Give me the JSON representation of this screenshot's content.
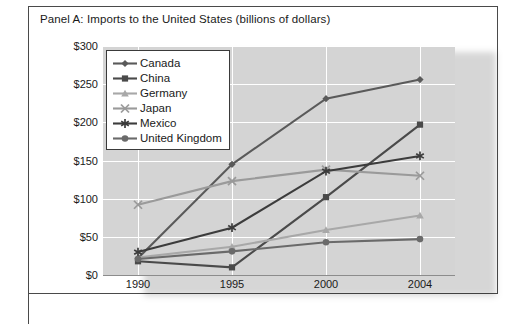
{
  "panel": {
    "title": "Panel A: Imports to the United States (billions of dollars)"
  },
  "chart_data": {
    "type": "line",
    "title": "Panel A: Imports to the United States (billions of dollars)",
    "xlabel": "",
    "ylabel": "Imports to the US (billions)",
    "categories": [
      "1990",
      "1995",
      "2000",
      "2004"
    ],
    "ylim": [
      0,
      300
    ],
    "yticks": [
      "$0",
      "$50",
      "$100",
      "$150",
      "$200",
      "$250",
      "$300"
    ],
    "ytick_values": [
      0,
      50,
      100,
      150,
      200,
      250,
      300
    ],
    "grid": true,
    "legend_position": "top-left-inside",
    "series": [
      {
        "name": "Canada",
        "marker": "diamond",
        "color": "#5a5a5a",
        "values": [
          22,
          145,
          231,
          256
        ]
      },
      {
        "name": "China",
        "marker": "square",
        "color": "#4a4a4a",
        "values": [
          18,
          10,
          102,
          197
        ]
      },
      {
        "name": "Germany",
        "marker": "triangle",
        "color": "#a8a8a8",
        "values": [
          23,
          37,
          59,
          78
        ]
      },
      {
        "name": "Japan",
        "marker": "x",
        "color": "#9a9a9a",
        "values": [
          92,
          123,
          138,
          130
        ]
      },
      {
        "name": "Mexico",
        "marker": "asterisk",
        "color": "#3c3c3c",
        "values": [
          30,
          62,
          136,
          156
        ]
      },
      {
        "name": "United Kingdom",
        "marker": "circle",
        "color": "#6a6a6a",
        "values": [
          21,
          31,
          43,
          47
        ]
      }
    ]
  },
  "legend": {
    "items": [
      {
        "label": "Canada"
      },
      {
        "label": "China"
      },
      {
        "label": "Germany"
      },
      {
        "label": "Japan"
      },
      {
        "label": "Mexico"
      },
      {
        "label": "United Kingdom"
      }
    ]
  },
  "colors": {
    "plot_background": "#d4d4d4",
    "gridline": "#ffffff",
    "frame": "#4a4a4a",
    "text": "#1a1a1a"
  }
}
